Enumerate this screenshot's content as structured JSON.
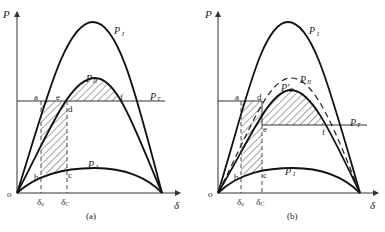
{
  "figure": {
    "panels": [
      {
        "id": "a",
        "caption": "(a)",
        "axis_y_label": "P",
        "axis_x_label": "δ",
        "origin_label": "o",
        "curves": {
          "P_I": {
            "label": "P",
            "sub": "I"
          },
          "P_II": {
            "label": "P",
            "sub": "II"
          },
          "P_III": {
            "label": "P",
            "sub": "I"
          },
          "P_T": {
            "label": "P",
            "sub": "T"
          }
        },
        "points": [
          "a",
          "b",
          "c",
          "d",
          "e",
          "f"
        ],
        "ticks": [
          {
            "label": "δ",
            "sub": "0"
          },
          {
            "label": "δ",
            "sub": "C"
          }
        ]
      },
      {
        "id": "b",
        "caption": "(b)",
        "axis_y_label": "P",
        "axis_x_label": "δ",
        "origin_label": "o",
        "curves": {
          "P_I": {
            "label": "P",
            "sub": "I"
          },
          "P_II": {
            "label": "P",
            "sub": "II"
          },
          "P_II_prime": {
            "label": "P′",
            "sub": "II"
          },
          "P_III": {
            "label": "P",
            "sub": "I"
          },
          "P_T": {
            "label": "P",
            "sub": "T"
          }
        },
        "points": [
          "a",
          "b",
          "c",
          "d",
          "e",
          "f"
        ],
        "ticks": [
          {
            "label": "δ",
            "sub": "0"
          },
          {
            "label": "δ",
            "sub": "C"
          }
        ]
      }
    ]
  },
  "labels": {
    "a": {
      "P": "P",
      "delta": "δ",
      "o": "o",
      "PI": "P",
      "PI_sub": "I",
      "PII": "P",
      "PII_sub": "II",
      "PIII": "P",
      "PIII_sub": "I",
      "PT": "P",
      "PT_sub": "T",
      "pa": "a",
      "pb": "b",
      "pc": "c",
      "pd": "d",
      "pe": "e",
      "pf": "f",
      "d0": "δ",
      "d0_sub": "0",
      "dC": "δ",
      "dC_sub": "C",
      "caption": "(a)"
    },
    "b": {
      "P": "P",
      "delta": "δ",
      "o": "o",
      "PI": "P",
      "PI_sub": "I",
      "PII": "P",
      "PII_sub": "II",
      "PIIp": "P′",
      "PIIp_sub": "II",
      "PIII": "P",
      "PIII_sub": "I",
      "PT": "P",
      "PT_sub": "T",
      "pa": "a",
      "pb": "b",
      "pc": "c",
      "pd": "d",
      "pe": "e",
      "pf": "f",
      "d0": "δ",
      "d0_sub": "0",
      "dC": "δ",
      "dC_sub": "C",
      "caption": "(b)"
    }
  }
}
